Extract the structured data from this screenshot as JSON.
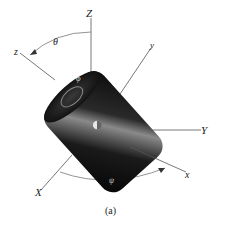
{
  "figure": {
    "caption": "(a)",
    "axes": {
      "Z": "Z",
      "Y": "Y",
      "X": "X",
      "z": "z",
      "y": "y",
      "x": "x"
    },
    "angles": {
      "theta": "θ",
      "phi": "ϕ",
      "psi": "ψ"
    },
    "colors": {
      "cylinder_dark": "#0a0a0a",
      "cylinder_highlight": "#9a9a9a",
      "axis_line": "#555555",
      "background": "#ffffff"
    }
  }
}
